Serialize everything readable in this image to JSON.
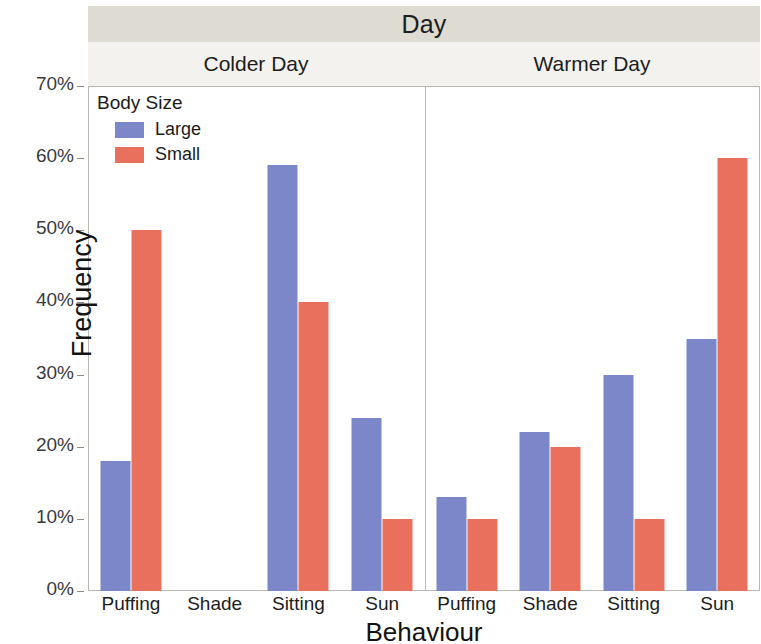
{
  "chart_data": {
    "type": "bar",
    "title": "Day",
    "xlabel": "Behaviour",
    "ylabel": "Frequency",
    "ylim": [
      0,
      70
    ],
    "ytick_labels": [
      "0%",
      "10%",
      "20%",
      "30%",
      "40%",
      "50%",
      "60%",
      "70%"
    ],
    "ytick_values": [
      0,
      10,
      20,
      30,
      40,
      50,
      60,
      70
    ],
    "grid": false,
    "legend": {
      "title": "Body Size",
      "position": "inside-top-left",
      "entries": [
        {
          "name": "Large",
          "color": "#7c87ca"
        },
        {
          "name": "Small",
          "color": "#e8705c"
        }
      ]
    },
    "facet_label": "Day",
    "facets": [
      {
        "name": "Colder Day",
        "categories": [
          "Puffing",
          "Shade",
          "Sitting",
          "Sun"
        ],
        "series": [
          {
            "name": "Large",
            "color": "#7c87ca",
            "values": [
              18,
              0,
              59,
              24
            ]
          },
          {
            "name": "Small",
            "color": "#e8705c",
            "values": [
              50,
              0,
              40,
              10
            ]
          }
        ]
      },
      {
        "name": "Warmer Day",
        "categories": [
          "Puffing",
          "Shade",
          "Sitting",
          "Sun"
        ],
        "series": [
          {
            "name": "Large",
            "color": "#7c87ca",
            "values": [
              13,
              22,
              30,
              35
            ]
          },
          {
            "name": "Small",
            "color": "#e8705c",
            "values": [
              10,
              20,
              10,
              60
            ]
          }
        ]
      }
    ]
  }
}
